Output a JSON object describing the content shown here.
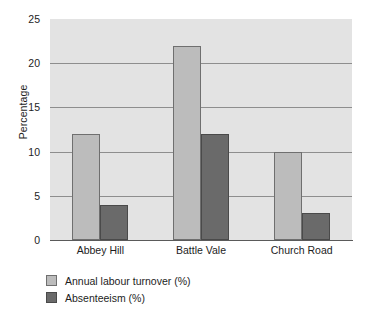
{
  "chart_data": {
    "type": "bar",
    "title": "",
    "subtitle": "",
    "xlabel": "",
    "ylabel": "Percentage",
    "categories": [
      "Abbey Hill",
      "Battle Vale",
      "Church Road"
    ],
    "series": [
      {
        "name": "Annual labour turnover (%)",
        "values": [
          12,
          22,
          10
        ],
        "color": "#bcbcbc"
      },
      {
        "name": "Absenteeism (%)",
        "values": [
          4,
          12,
          3
        ],
        "color": "#6a6a6a"
      }
    ],
    "ylim": [
      0,
      25
    ],
    "yticks": [
      0,
      5,
      10,
      15,
      20,
      25
    ],
    "ytick_labels": [
      "0",
      "5",
      "10",
      "15",
      "20",
      "25"
    ],
    "grid": true,
    "grid_axis": "y",
    "legend_position": "below-left",
    "plot_background": "#e3e3e3",
    "axis_color": "#5a5a5a",
    "grid_color": "#8e8e8e",
    "page_background": "#ffffff"
  }
}
